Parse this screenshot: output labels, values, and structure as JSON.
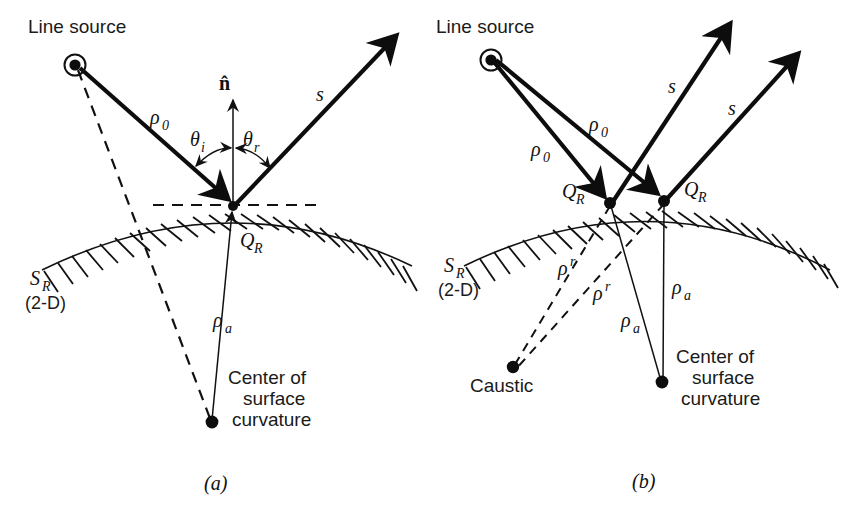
{
  "figure": {
    "background_color": "#ffffff",
    "ink_color": "#111111"
  },
  "panels": [
    {
      "id": "a",
      "caption": "(a)",
      "labels": {
        "line_source": "Line source",
        "rho_0": "ρ",
        "rho_0_sub": "0",
        "normal": "n̂",
        "theta_i": "θ",
        "theta_i_sub": "i",
        "theta_r": "θ",
        "theta_r_sub": "r",
        "s": "s",
        "q_r": "Q",
        "q_r_sub": "R",
        "surface": "S",
        "surface_sub": "R",
        "dimension": "(2-D)",
        "rho_a": "ρ",
        "rho_a_sub": "a",
        "center_line1": "Center of",
        "center_line2": "surface",
        "center_line3": "curvature"
      }
    },
    {
      "id": "b",
      "caption": "(b)",
      "labels": {
        "line_source": "Line source",
        "rho_0_left": "ρ",
        "rho_0_left_sub": "0",
        "rho_0_right": "ρ",
        "rho_0_right_sub": "0",
        "s_left": "s",
        "s_right": "s",
        "q_r_left": "Q",
        "q_r_left_sub": "R",
        "q_r_right": "Q",
        "q_r_right_sub": "R",
        "surface": "S",
        "surface_sub": "R",
        "dimension": "(2-D)",
        "rho_r_upper": "ρ",
        "rho_r_upper_sup": "r",
        "rho_r_lower": "ρ",
        "rho_r_lower_sup": "r",
        "rho_a_left": "ρ",
        "rho_a_left_sub": "a",
        "rho_a_right": "ρ",
        "rho_a_right_sub": "a",
        "caustic": "Caustic",
        "center_line1": "Center of",
        "center_line2": "surface",
        "center_line3": "curvature"
      }
    }
  ]
}
